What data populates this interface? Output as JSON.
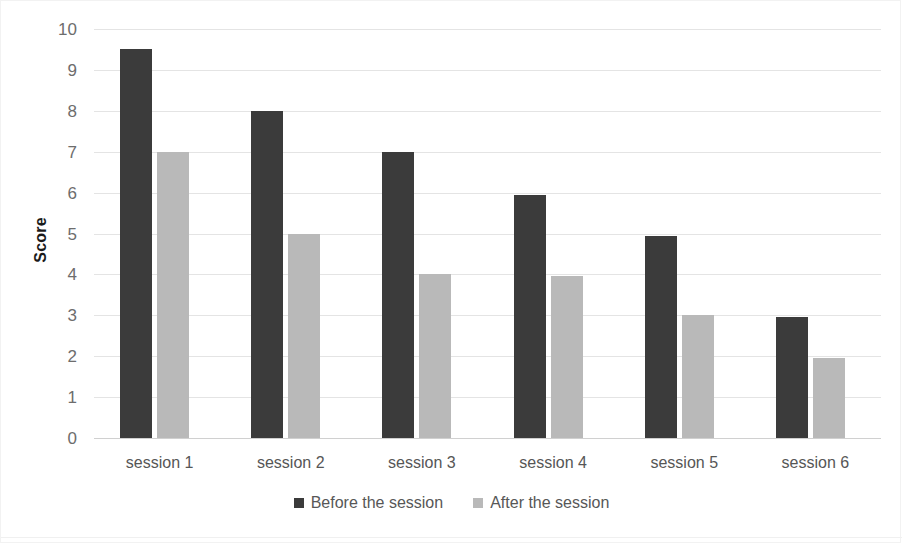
{
  "chart_data": {
    "type": "bar",
    "title": "",
    "xlabel": "",
    "ylabel": "Score",
    "ylim": [
      0,
      10
    ],
    "ytick_step": 1,
    "yticks": [
      "10",
      "9",
      "8",
      "7",
      "6",
      "5",
      "4",
      "3",
      "2",
      "1",
      "0"
    ],
    "grid": true,
    "legend_position": "bottom",
    "categories": [
      "session 1",
      "session 2",
      "session 3",
      "session 4",
      "session 5",
      "session 6"
    ],
    "series": [
      {
        "name": "Before the session",
        "color": "#3b3b3b",
        "values": [
          9.5,
          8,
          7,
          5.95,
          4.95,
          2.95
        ]
      },
      {
        "name": "After the session",
        "color": "#b9b9b9",
        "values": [
          7,
          5,
          4,
          3.95,
          3,
          1.95
        ]
      }
    ]
  },
  "axis": {
    "y_title": "Score"
  },
  "legend": {
    "items": [
      {
        "label": "Before the session",
        "swatch": "legend-swatch-before"
      },
      {
        "label": "After the session",
        "swatch": "legend-swatch-after"
      }
    ]
  }
}
